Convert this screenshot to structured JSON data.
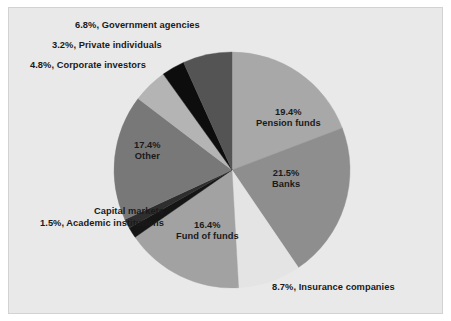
{
  "figure": {
    "background": "#e9e9e9",
    "page_background": "#ffffff",
    "border_color": "#d2d2d2",
    "text_color": "#1a1a1a"
  },
  "chart_data": {
    "type": "pie",
    "title": "",
    "subtitle": "",
    "xlabel": "",
    "ylabel": "",
    "grid": false,
    "legend_position": "none",
    "labels_placement": "callout-and-inside",
    "start_angle_deg": 0,
    "direction": "clockwise",
    "center": {
      "x": 232,
      "y": 170
    },
    "radius": 118,
    "units": "percent",
    "categories": [
      "Pension funds",
      "Banks",
      "Insurance companies",
      "Fund of funds",
      "Academic institutions",
      "Capital markets",
      "Other",
      "Corporate investors",
      "Private individuals",
      "Government agencies"
    ],
    "values": [
      19.4,
      21.5,
      8.7,
      16.4,
      1.5,
      1.3,
      17.4,
      4.8,
      3.2,
      6.8
    ],
    "colors": [
      "#a8a8a8",
      "#8e8e8e",
      "#e4e4e4",
      "#a2a2a2",
      "#151515",
      "#2e2e2e",
      "#787878",
      "#b4b4b4",
      "#0d0d0d",
      "#545454"
    ],
    "slices": [
      {
        "label": "Pension funds",
        "value": 19.4,
        "value_text": "19.4%",
        "color": "#a8a8a8",
        "label_position": "inside"
      },
      {
        "label": "Banks",
        "value": 21.5,
        "value_text": "21.5%",
        "color": "#8e8e8e",
        "label_position": "inside"
      },
      {
        "label": "Insurance companies",
        "value": 8.7,
        "value_text": "8.7%",
        "color": "#e4e4e4",
        "label_position": "outside-right"
      },
      {
        "label": "Fund of funds",
        "value": 16.4,
        "value_text": "16.4%",
        "color": "#a2a2a2",
        "label_position": "inside"
      },
      {
        "label": "Academic institutions",
        "value": 1.5,
        "value_text": "1.5%",
        "color": "#151515",
        "label_position": "outside-left"
      },
      {
        "label": "Capital markets",
        "value": 1.3,
        "value_text": "",
        "color": "#2e2e2e",
        "label_position": "outside-left"
      },
      {
        "label": "Other",
        "value": 17.4,
        "value_text": "17.4%",
        "color": "#787878",
        "label_position": "inside"
      },
      {
        "label": "Corporate investors",
        "value": 4.8,
        "value_text": "4.8%",
        "color": "#b4b4b4",
        "label_position": "outside-left"
      },
      {
        "label": "Private individuals",
        "value": 3.2,
        "value_text": "3.2%",
        "color": "#0d0d0d",
        "label_position": "outside-left"
      },
      {
        "label": "Government agencies",
        "value": 6.8,
        "value_text": "6.8%",
        "color": "#545454",
        "label_position": "outside-left"
      }
    ]
  },
  "labels": {
    "pension_pct": "19.4%",
    "pension_name": "Pension funds",
    "banks_pct": "21.5%",
    "banks_name": "Banks",
    "insurance": "8.7%, Insurance companies",
    "fundoffunds_pct": "16.4%",
    "fundoffunds_name": "Fund of funds",
    "other_pct": "17.4%",
    "other_name": "Other",
    "capital_markets": "Capital markets",
    "academic": "1.5%, Academic institutions",
    "corporate": "4.8%, Corporate investors",
    "private": "3.2%, Private individuals",
    "government": "6.8%, Government agencies"
  }
}
